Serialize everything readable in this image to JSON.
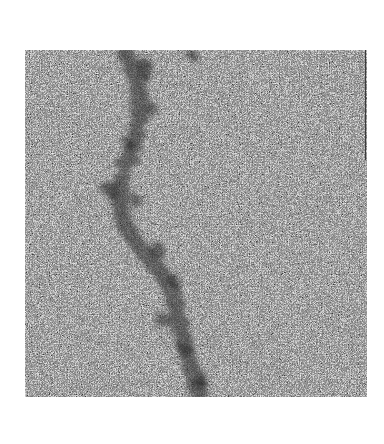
{
  "image": {
    "kind": "electron-micrograph",
    "description": "Noisy grayscale micrograph showing a dark helical filament running top-to-bottom",
    "frame": {
      "x": 25,
      "y": 50,
      "width": 342,
      "height": 347
    },
    "background_color": "#ffffff",
    "noise_base_gray": "#9a9a9a",
    "filament": {
      "color": "#2a2a2a",
      "path_points": [
        [
          100,
          0
        ],
        [
          108,
          25
        ],
        [
          118,
          55
        ],
        [
          110,
          85
        ],
        [
          95,
          115
        ],
        [
          90,
          145
        ],
        [
          105,
          175
        ],
        [
          130,
          205
        ],
        [
          150,
          235
        ],
        [
          150,
          265
        ],
        [
          160,
          295
        ],
        [
          170,
          325
        ],
        [
          175,
          347
        ]
      ]
    }
  }
}
